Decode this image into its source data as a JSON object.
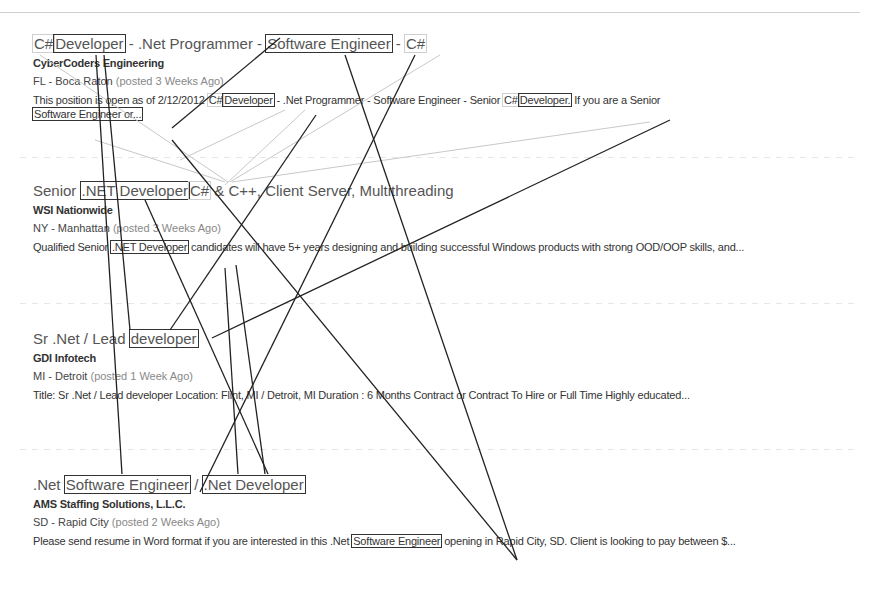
{
  "jobs": [
    {
      "title_parts": [
        "C#",
        "Developer",
        " - .Net Programmer - ",
        "Software Engineer",
        " - ",
        "C#"
      ],
      "company": "CyberCoders Engineering",
      "location": "FL - Boca Raton",
      "posted": "(posted 3 Weeks Ago)",
      "desc_parts": [
        "This position is open as of 2/12/2012 ",
        "C#",
        "Developer",
        " - .Net Programmer - Software Engineer - Senior ",
        "C#",
        "Developer.",
        " If you are a Senior ",
        "Software Engineer or..."
      ]
    },
    {
      "title_parts": [
        "Senior ",
        ".NET Developer",
        "C#",
        " & C++, Client Server, Multithreading"
      ],
      "company": "WSI Nationwide",
      "location": "NY - Manhattan",
      "posted": "(posted 3 Weeks Ago)",
      "desc_parts": [
        "Qualified Senior ",
        ".NET Developer",
        " candidates will have 5+ years designing and building successful Windows products with strong OOD/OOP skills, and..."
      ]
    },
    {
      "title_parts": [
        "Sr .Net / Lead ",
        "developer"
      ],
      "company": "GDI Infotech",
      "location": "MI - Detroit",
      "posted": "(posted 1 Week Ago)",
      "desc": "Title: Sr .Net / Lead developer Location: Flint, MI / Detroit, MI Duration : 6 Months Contract or Contract To Hire or Full Time   Highly educated..."
    },
    {
      "title_parts": [
        ".Net ",
        "Software Engineer",
        " / ",
        ".Net Developer"
      ],
      "company": "AMS Staffing Solutions, L.L.C.",
      "location": "SD - Rapid City",
      "posted": "(posted 2 Weeks Ago)",
      "desc_parts": [
        "Please send resume in Word format if you are interested in this .Net ",
        "Software Engineer",
        " opening in Rapid City, SD. Client is looking to pay between $..."
      ]
    }
  ],
  "overlay": {
    "dark_color": "#222222",
    "light_color": "#c8c8c8",
    "dark_lines": [
      [
        172,
        128,
        280,
        38
      ],
      [
        415,
        55,
        200,
        492
      ],
      [
        345,
        55,
        517,
        560
      ],
      [
        96,
        55,
        122,
        474
      ],
      [
        104,
        55,
        130,
        330
      ],
      [
        172,
        140,
        517,
        560
      ],
      [
        316,
        115,
        170,
        330
      ],
      [
        670,
        120,
        212,
        338
      ],
      [
        145,
        200,
        268,
        474
      ],
      [
        236,
        265,
        265,
        474
      ],
      [
        225,
        268,
        238,
        474
      ]
    ],
    "light_lines": [
      [
        440,
        55,
        230,
        182
      ],
      [
        40,
        55,
        228,
        182
      ],
      [
        305,
        110,
        225,
        185
      ],
      [
        650,
        122,
        232,
        182
      ],
      [
        95,
        140,
        225,
        182
      ],
      [
        285,
        110,
        180,
        160
      ]
    ]
  }
}
